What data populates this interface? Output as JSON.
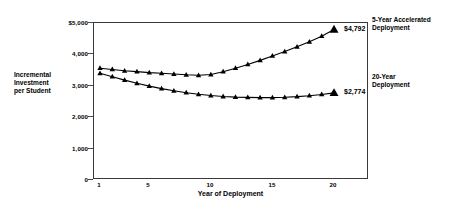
{
  "chart_data": {
    "type": "line",
    "title": "",
    "subtitle": "",
    "xlabel": "Year of Deployment",
    "ylabel": "Incremental Investment per Student",
    "xlim": [
      0.2,
      20.8
    ],
    "ylim": [
      0,
      5000
    ],
    "grid": false,
    "legend_position": "right",
    "x": [
      1,
      2,
      3,
      4,
      5,
      6,
      7,
      8,
      9,
      10,
      11,
      12,
      13,
      14,
      15,
      16,
      17,
      18,
      19,
      20
    ],
    "x_tick_labels": [
      "1",
      "5",
      "10",
      "15",
      "20"
    ],
    "x_tick_values": [
      1,
      5,
      10,
      15,
      20
    ],
    "y_tick_labels": [
      "$5,000",
      "4,000",
      "3,000",
      "2,000",
      "1,000",
      "0"
    ],
    "y_tick_values": [
      5000,
      4000,
      3000,
      2000,
      1000,
      0
    ],
    "marker": "triangle",
    "series": [
      {
        "name": "5-Year Accelerated Deployment",
        "legend_label_line1": "5-Year Accelerated",
        "legend_label_line2": "Deployment",
        "end_value_label": "$4,792",
        "end_value": 4792,
        "color": "#000000",
        "values": [
          3560,
          3520,
          3480,
          3450,
          3420,
          3400,
          3375,
          3350,
          3335,
          3360,
          3450,
          3560,
          3680,
          3810,
          3950,
          4090,
          4240,
          4400,
          4580,
          4792
        ]
      },
      {
        "name": "20-Year Deployment",
        "legend_label_line1": "20-Year",
        "legend_label_line2": "Deployment",
        "end_value_label": "$2,774",
        "end_value": 2774,
        "color": "#000000",
        "values": [
          3400,
          3290,
          3180,
          3080,
          2990,
          2910,
          2840,
          2780,
          2730,
          2690,
          2660,
          2640,
          2630,
          2625,
          2625,
          2635,
          2655,
          2685,
          2725,
          2774
        ]
      }
    ]
  },
  "axis": {
    "y_title_line1": "Incremental",
    "y_title_line2": "Investment",
    "y_title_line3": "per Student",
    "x_title": "Year of Deployment"
  }
}
